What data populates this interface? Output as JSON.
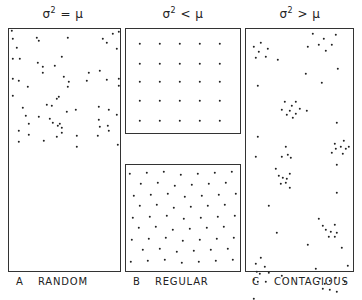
{
  "headers": [
    {
      "sym": "σ",
      "sup": "2",
      "rel": " = μ"
    },
    {
      "sym": "σ",
      "sup": "2",
      "rel": " < μ"
    },
    {
      "sym": "σ",
      "sup": "2",
      "rel": " > μ"
    }
  ],
  "captions": [
    {
      "letter": "A",
      "label": "RANDOM"
    },
    {
      "letter": "B",
      "label": "REGULAR"
    },
    {
      "letter": "C",
      "label": "CONTAGIOUS"
    }
  ],
  "panels": {
    "random": {
      "x": 8,
      "y": 28,
      "w": 113,
      "h": 244,
      "dots": [
        [
          3,
          2
        ],
        [
          28,
          9
        ],
        [
          59,
          9
        ],
        [
          98,
          14
        ],
        [
          8,
          19
        ],
        [
          4,
          30
        ],
        [
          53,
          28
        ],
        [
          29,
          34
        ],
        [
          34,
          38
        ],
        [
          34,
          44
        ],
        [
          80,
          44
        ],
        [
          4,
          50
        ],
        [
          19,
          58
        ],
        [
          59,
          58
        ],
        [
          48,
          70
        ],
        [
          50,
          68
        ],
        [
          67,
          81
        ],
        [
          58,
          83
        ],
        [
          90,
          78
        ],
        [
          100,
          81
        ],
        [
          108,
          86
        ],
        [
          30,
          88
        ],
        [
          41,
          90
        ],
        [
          44,
          94
        ],
        [
          51,
          95
        ],
        [
          49,
          97
        ],
        [
          53,
          99
        ],
        [
          91,
          98
        ],
        [
          99,
          97
        ],
        [
          10,
          102
        ],
        [
          53,
          104
        ],
        [
          20,
          106
        ],
        [
          48,
          108
        ],
        [
          89,
          107
        ],
        [
          68,
          118
        ],
        [
          109,
          116
        ],
        [
          10,
          113
        ],
        [
          30,
          12
        ],
        [
          4,
          10
        ],
        [
          94,
          10
        ],
        [
          104,
          5
        ],
        [
          110,
          3
        ],
        [
          108,
          20
        ],
        [
          11,
          30
        ],
        [
          91,
          42
        ],
        [
          46,
          37
        ],
        [
          55,
          48
        ],
        [
          60,
          53
        ],
        [
          78,
          52
        ],
        [
          98,
          51
        ],
        [
          110,
          50
        ],
        [
          10,
          52
        ],
        [
          110,
          57
        ],
        [
          4,
          67
        ],
        [
          14,
          79
        ],
        [
          17,
          87
        ],
        [
          20,
          95
        ],
        [
          38,
          76
        ],
        [
          43,
          77
        ],
        [
          90,
          91
        ],
        [
          100,
          102
        ],
        [
          35,
          112
        ],
        [
          68,
          107
        ]
      ]
    },
    "regular_grid": {
      "x": 125,
      "y": 28,
      "w": 116,
      "h": 106,
      "dots": [
        [
          14,
          15
        ],
        [
          34,
          15
        ],
        [
          54,
          15
        ],
        [
          74,
          15
        ],
        [
          94,
          15
        ],
        [
          14,
          35
        ],
        [
          34,
          35
        ],
        [
          54,
          35
        ],
        [
          74,
          35
        ],
        [
          94,
          35
        ],
        [
          14,
          53
        ],
        [
          34,
          53
        ],
        [
          54,
          53
        ],
        [
          74,
          53
        ],
        [
          94,
          53
        ],
        [
          14,
          72
        ],
        [
          34,
          72
        ],
        [
          54,
          72
        ],
        [
          74,
          72
        ],
        [
          94,
          72
        ],
        [
          14,
          92
        ],
        [
          34,
          92
        ],
        [
          54,
          92
        ],
        [
          74,
          92
        ],
        [
          94,
          92
        ]
      ]
    },
    "regular_hex": {
      "x": 125,
      "y": 164,
      "w": 116,
      "h": 108
    },
    "contagious": {
      "x": 245,
      "y": 28,
      "w": 109,
      "h": 244,
      "dots": [
        [
          8,
          18
        ],
        [
          15,
          14
        ],
        [
          22,
          20
        ],
        [
          13,
          23
        ],
        [
          10,
          29
        ],
        [
          20,
          28
        ],
        [
          32,
          31
        ],
        [
          67,
          5
        ],
        [
          78,
          10
        ],
        [
          73,
          16
        ],
        [
          62,
          18
        ],
        [
          90,
          6
        ],
        [
          86,
          16
        ],
        [
          80,
          22
        ],
        [
          92,
          40
        ],
        [
          60,
          45
        ],
        [
          76,
          54
        ],
        [
          12,
          57
        ],
        [
          39,
          73
        ],
        [
          50,
          73
        ],
        [
          46,
          77
        ],
        [
          36,
          81
        ],
        [
          44,
          82
        ],
        [
          54,
          80
        ],
        [
          41,
          86
        ],
        [
          50,
          85
        ],
        [
          47,
          89
        ],
        [
          61,
          82
        ],
        [
          91,
          94
        ],
        [
          12,
          108
        ],
        [
          89,
          115
        ],
        [
          98,
          112
        ],
        [
          95,
          118
        ],
        [
          90,
          120
        ],
        [
          100,
          120
        ],
        [
          86,
          124
        ],
        [
          97,
          125
        ],
        [
          103,
          118
        ],
        [
          40,
          118
        ],
        [
          42,
          126
        ],
        [
          10,
          128
        ],
        [
          36,
          128
        ],
        [
          45,
          129
        ],
        [
          91,
          136
        ],
        [
          30,
          140
        ],
        [
          33,
          147
        ],
        [
          37,
          149
        ],
        [
          41,
          150
        ],
        [
          44,
          145
        ],
        [
          40,
          154
        ],
        [
          35,
          155
        ],
        [
          44,
          159
        ],
        [
          91,
          164
        ],
        [
          23,
          177
        ],
        [
          73,
          190
        ],
        [
          77,
          197
        ],
        [
          89,
          196
        ],
        [
          85,
          203
        ],
        [
          91,
          204
        ],
        [
          80,
          201
        ],
        [
          83,
          208
        ],
        [
          89,
          208
        ],
        [
          31,
          204
        ],
        [
          62,
          216
        ],
        [
          96,
          219
        ],
        [
          15,
          229
        ],
        [
          10,
          235
        ],
        [
          19,
          238
        ],
        [
          11,
          243
        ],
        [
          14,
          245
        ],
        [
          23,
          244
        ],
        [
          8,
          251
        ],
        [
          12,
          253
        ],
        [
          20,
          253
        ],
        [
          36,
          247
        ],
        [
          70,
          240
        ],
        [
          74,
          250
        ],
        [
          79,
          255
        ],
        [
          84,
          252
        ],
        [
          90,
          249
        ],
        [
          77,
          260
        ],
        [
          84,
          261
        ],
        [
          91,
          263
        ],
        [
          99,
          253
        ],
        [
          102,
          237
        ],
        [
          8,
          270
        ]
      ]
    }
  }
}
